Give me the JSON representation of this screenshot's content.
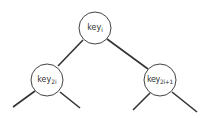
{
  "diagram": {
    "type": "binary-heap-subtree",
    "colors": {
      "stroke": "#333333",
      "fill": "#ffffff",
      "text": "#333333"
    },
    "nodes": [
      {
        "id": "root",
        "base": "key",
        "sub": "i",
        "cx": 95,
        "cy": 28,
        "r": 16
      },
      {
        "id": "left",
        "base": "key",
        "sub": "2i",
        "cx": 47,
        "cy": 80,
        "r": 16
      },
      {
        "id": "right",
        "base": "key",
        "sub": "2i+1",
        "cx": 160,
        "cy": 80,
        "r": 16
      }
    ],
    "edges": [
      {
        "from": "root",
        "to": "left"
      },
      {
        "from": "root",
        "to": "right"
      },
      {
        "from": "left",
        "to": "left-child-left-stub"
      },
      {
        "from": "left",
        "to": "left-child-right-stub"
      },
      {
        "from": "right",
        "to": "right-child-left-stub"
      },
      {
        "from": "right",
        "to": "right-child-right-stub"
      }
    ]
  }
}
